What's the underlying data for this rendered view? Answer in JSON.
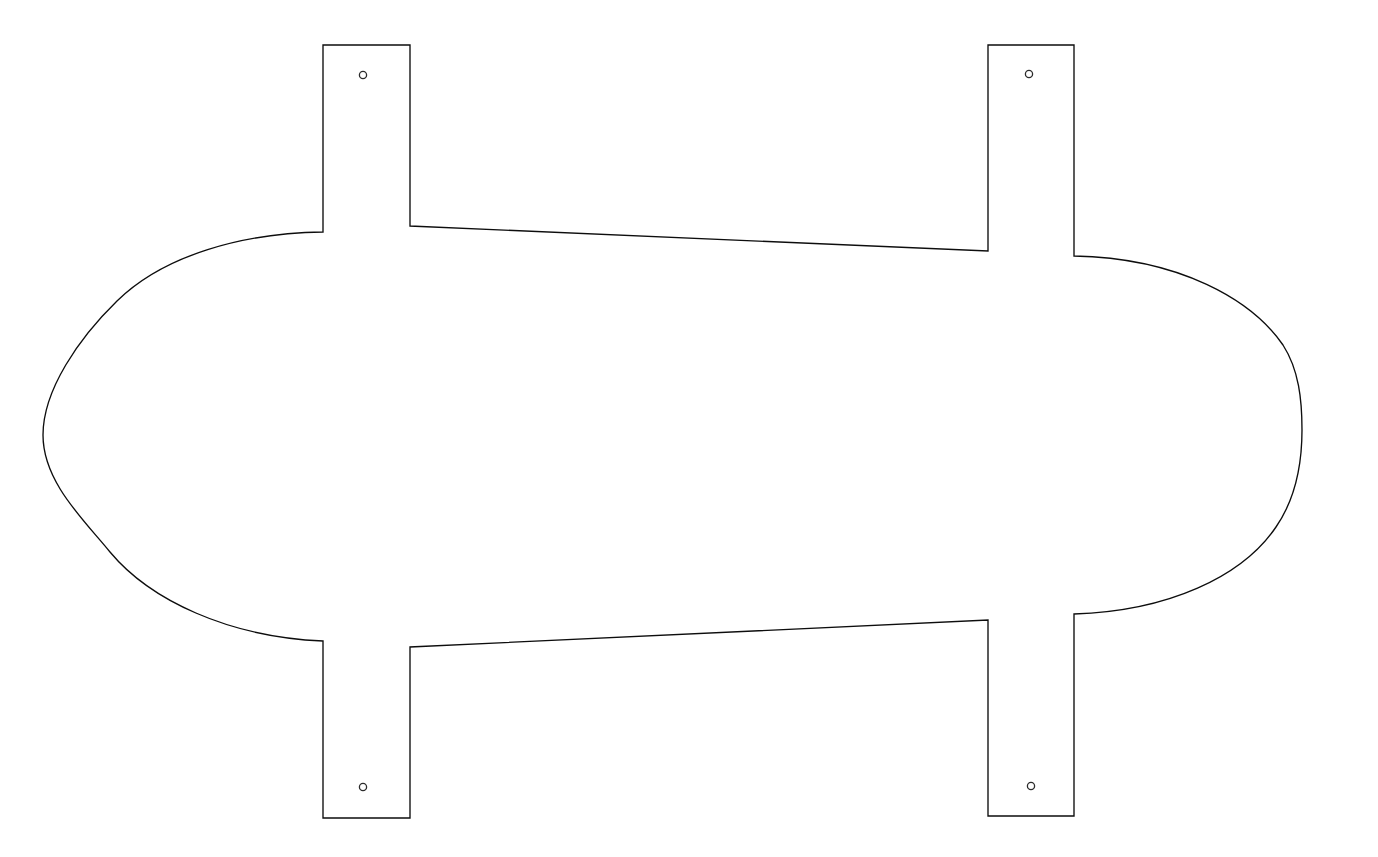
{
  "document": {
    "type": "technical-outline-drawing",
    "title": "Flat Pattern Outline",
    "background_color": "#ffffff",
    "stroke_color": "#0d0d0d",
    "stroke_width_px": 1.35,
    "canvas": {
      "width": 1378,
      "height": 857
    }
  },
  "geometry": {
    "description": "Stadium-shaped body with four rectangular mounting tabs, each containing one circular hole",
    "body": {
      "name": "main-body",
      "shape": "stadium",
      "leftmost_x": 43,
      "rightmost_x": 1302,
      "left_vertical_center_y": 435,
      "right_vertical_center_y": 430,
      "top_edge_left_x": 410,
      "top_edge_left_y": 226,
      "top_edge_right_x": 988,
      "top_edge_right_y": 251,
      "bottom_edge_left_x": 410,
      "bottom_edge_left_y": 647,
      "bottom_edge_right_x": 988,
      "bottom_edge_right_y": 620
    },
    "tabs": [
      {
        "id": "tab-top-left",
        "position": "top-left",
        "left_x": 323,
        "right_x": 410,
        "outer_y": 45,
        "inner_left_y": 232,
        "inner_right_y": 226,
        "width": 87,
        "height": 187,
        "hole": {
          "cx": 363,
          "cy": 75,
          "r": 3.6
        }
      },
      {
        "id": "tab-top-right",
        "position": "top-right",
        "left_x": 988,
        "right_x": 1074,
        "outer_y": 45,
        "inner_left_y": 251,
        "inner_right_y": 256,
        "width": 86,
        "height": 211,
        "hole": {
          "cx": 1029,
          "cy": 74,
          "r": 3.6
        }
      },
      {
        "id": "tab-bottom-left",
        "position": "bottom-left",
        "left_x": 323,
        "right_x": 410,
        "outer_y": 818,
        "inner_left_y": 641,
        "inner_right_y": 647,
        "width": 87,
        "height": 177,
        "hole": {
          "cx": 363,
          "cy": 787,
          "r": 3.6
        }
      },
      {
        "id": "tab-bottom-right",
        "position": "bottom-right",
        "left_x": 988,
        "right_x": 1074,
        "outer_y": 816,
        "inner_left_y": 620,
        "inner_right_y": 614,
        "width": 86,
        "height": 202,
        "hole": {
          "cx": 1031,
          "cy": 786,
          "r": 3.6
        }
      }
    ],
    "outline_path": "M 323 45 L 410 45 L 410 226 L 988 251 L 988 45 L 1074 45 L 1074 256 C 1180 258 1252 300 1283 345 C 1299 370 1302 400 1302 430 C 1302 462 1296 498 1276 527 C 1242 577 1168 611 1074 614 L 1074 816 L 988 816 L 988 620 L 410 647 L 410 818 L 323 818 L 323 641 C 228 637 150 600 110 552 C 84 520 43 482 43 435 C 43 390 79 338 117 301 C 164 255 243 233 323 232 Z",
    "holes": [
      {
        "id": "hole-top-left",
        "cx": 363,
        "cy": 75,
        "r": 3.6
      },
      {
        "id": "hole-top-right",
        "cx": 1029,
        "cy": 74,
        "r": 3.6
      },
      {
        "id": "hole-bottom-left",
        "cx": 363,
        "cy": 787,
        "r": 3.6
      },
      {
        "id": "hole-bottom-right",
        "cx": 1031,
        "cy": 786,
        "r": 3.6
      }
    ]
  }
}
